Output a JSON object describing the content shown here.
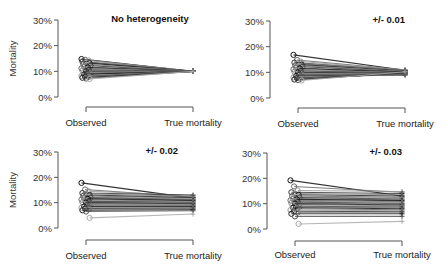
{
  "chart_data": [
    {
      "type": "line",
      "subtype": "paired-slope",
      "title": "No heterogeneity",
      "ylabel": "Mortality",
      "xlabel": "",
      "categories": [
        "Observed",
        "True mortality"
      ],
      "yticks": [
        "0%",
        "10%",
        "20%",
        "30%"
      ],
      "ylim": [
        0,
        0.3
      ],
      "observed": [
        0.148,
        0.145,
        0.142,
        0.138,
        0.135,
        0.132,
        0.128,
        0.125,
        0.122,
        0.118,
        0.115,
        0.112,
        0.108,
        0.105,
        0.103,
        0.1,
        0.098,
        0.095,
        0.092,
        0.09,
        0.088,
        0.085,
        0.082,
        0.08,
        0.078,
        0.075,
        0.072,
        0.07
      ],
      "true": [
        0.1,
        0.1,
        0.1,
        0.1,
        0.1,
        0.1,
        0.1,
        0.1,
        0.1,
        0.1,
        0.1,
        0.1,
        0.1,
        0.1,
        0.1,
        0.1,
        0.1,
        0.1,
        0.1,
        0.1,
        0.1,
        0.1,
        0.1,
        0.1,
        0.1,
        0.1,
        0.1,
        0.1
      ]
    },
    {
      "type": "line",
      "subtype": "paired-slope",
      "title": "+/- 0.01",
      "ylabel": "",
      "xlabel": "",
      "categories": [
        "Observed",
        "True mortality"
      ],
      "yticks": [
        "0%",
        "10%",
        "20%",
        "30%"
      ],
      "ylim": [
        0,
        0.3
      ],
      "observed": [
        0.168,
        0.148,
        0.142,
        0.138,
        0.135,
        0.13,
        0.127,
        0.124,
        0.122,
        0.118,
        0.115,
        0.112,
        0.108,
        0.105,
        0.102,
        0.1,
        0.097,
        0.094,
        0.092,
        0.089,
        0.086,
        0.083,
        0.08,
        0.078,
        0.075,
        0.072,
        0.07,
        0.068
      ],
      "true": [
        0.108,
        0.11,
        0.109,
        0.107,
        0.106,
        0.105,
        0.104,
        0.103,
        0.102,
        0.1,
        0.101,
        0.099,
        0.098,
        0.097,
        0.096,
        0.095,
        0.094,
        0.093,
        0.092,
        0.091,
        0.09,
        0.09,
        0.092,
        0.094,
        0.096,
        0.098,
        0.1,
        0.102
      ]
    },
    {
      "type": "line",
      "subtype": "paired-slope",
      "title": "+/- 0.02",
      "ylabel": "Mortality",
      "xlabel": "",
      "categories": [
        "Observed",
        "True mortality"
      ],
      "yticks": [
        "0%",
        "10%",
        "20%",
        "30%"
      ],
      "ylim": [
        0,
        0.3
      ],
      "observed": [
        0.178,
        0.152,
        0.145,
        0.138,
        0.135,
        0.13,
        0.127,
        0.124,
        0.12,
        0.118,
        0.115,
        0.112,
        0.108,
        0.105,
        0.102,
        0.1,
        0.097,
        0.094,
        0.091,
        0.088,
        0.085,
        0.082,
        0.08,
        0.077,
        0.074,
        0.07,
        0.065,
        0.04
      ],
      "true": [
        0.118,
        0.122,
        0.128,
        0.13,
        0.125,
        0.12,
        0.118,
        0.115,
        0.112,
        0.11,
        0.108,
        0.105,
        0.103,
        0.1,
        0.098,
        0.096,
        0.094,
        0.092,
        0.09,
        0.088,
        0.085,
        0.082,
        0.08,
        0.078,
        0.075,
        0.072,
        0.068,
        0.055
      ]
    },
    {
      "type": "line",
      "subtype": "paired-slope",
      "title": "+/- 0.03",
      "ylabel": "",
      "xlabel": "",
      "categories": [
        "Observed",
        "True mortality"
      ],
      "yticks": [
        "0%",
        "10%",
        "20%",
        "30%"
      ],
      "ylim": [
        0,
        0.3
      ],
      "observed": [
        0.192,
        0.168,
        0.152,
        0.145,
        0.14,
        0.135,
        0.13,
        0.127,
        0.124,
        0.12,
        0.117,
        0.113,
        0.11,
        0.106,
        0.103,
        0.1,
        0.097,
        0.094,
        0.09,
        0.087,
        0.084,
        0.08,
        0.075,
        0.07,
        0.065,
        0.06,
        0.05,
        0.02
      ],
      "true": [
        0.13,
        0.145,
        0.148,
        0.14,
        0.135,
        0.13,
        0.125,
        0.122,
        0.118,
        0.115,
        0.112,
        0.108,
        0.105,
        0.1,
        0.098,
        0.095,
        0.092,
        0.09,
        0.087,
        0.084,
        0.08,
        0.076,
        0.072,
        0.068,
        0.064,
        0.06,
        0.05,
        0.03
      ]
    }
  ]
}
